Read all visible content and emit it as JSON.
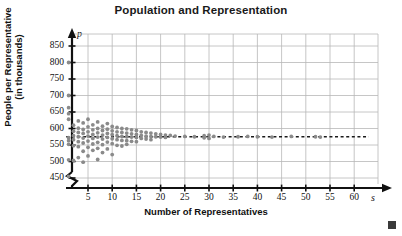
{
  "chart_data": {
    "type": "scatter",
    "title": "Population and Representation",
    "xlabel": "Number of Representatives",
    "ylabel_line1": "People per Representative",
    "ylabel_line2": "(in thousands)",
    "x_variable": "s",
    "y_variable": "p",
    "xlim": [
      0,
      63
    ],
    "ylim": [
      440,
      870
    ],
    "xticks": [
      5,
      10,
      15,
      20,
      25,
      30,
      35,
      40,
      45,
      50,
      55,
      60
    ],
    "yticks": [
      450,
      500,
      550,
      600,
      650,
      700,
      750,
      800,
      850
    ],
    "grid": true,
    "y_axis_break": true,
    "legend": "none",
    "marker_color": "#8a8a8a",
    "grid_color": "#b8b8b8",
    "axis_color": "#111111",
    "trend_line": {
      "type": "horizontal-dashed",
      "value": 575,
      "x_start": 0.5,
      "x_end": 63,
      "color": "#1a1a1a",
      "style": "dashed"
    },
    "points": [
      [
        1,
        800
      ],
      [
        1,
        700
      ],
      [
        1,
        663
      ],
      [
        1,
        645
      ],
      [
        1,
        628
      ],
      [
        1,
        572
      ],
      [
        1,
        563
      ],
      [
        1,
        552
      ],
      [
        1,
        505
      ],
      [
        1,
        455
      ],
      [
        2,
        610
      ],
      [
        2,
        592
      ],
      [
        2,
        578
      ],
      [
        2,
        566
      ],
      [
        2,
        548
      ],
      [
        2,
        503
      ],
      [
        3,
        623
      ],
      [
        3,
        601
      ],
      [
        3,
        588
      ],
      [
        3,
        575
      ],
      [
        3,
        560
      ],
      [
        3,
        545
      ],
      [
        3,
        512
      ],
      [
        4,
        617
      ],
      [
        4,
        597
      ],
      [
        4,
        585
      ],
      [
        4,
        571
      ],
      [
        4,
        556
      ],
      [
        4,
        531
      ],
      [
        4,
        498
      ],
      [
        5,
        628
      ],
      [
        5,
        605
      ],
      [
        5,
        590
      ],
      [
        5,
        577
      ],
      [
        5,
        562
      ],
      [
        5,
        543
      ],
      [
        5,
        517
      ],
      [
        6,
        611
      ],
      [
        6,
        596
      ],
      [
        6,
        582
      ],
      [
        6,
        570
      ],
      [
        6,
        553
      ],
      [
        6,
        534
      ],
      [
        7,
        620
      ],
      [
        7,
        600
      ],
      [
        7,
        587
      ],
      [
        7,
        574
      ],
      [
        7,
        558
      ],
      [
        7,
        540
      ],
      [
        7,
        506
      ],
      [
        8,
        607
      ],
      [
        8,
        594
      ],
      [
        8,
        580
      ],
      [
        8,
        568
      ],
      [
        8,
        551
      ],
      [
        8,
        527
      ],
      [
        9,
        615
      ],
      [
        9,
        598
      ],
      [
        9,
        585
      ],
      [
        9,
        573
      ],
      [
        9,
        559
      ],
      [
        9,
        538
      ],
      [
        10,
        606
      ],
      [
        10,
        593
      ],
      [
        10,
        581
      ],
      [
        10,
        569
      ],
      [
        10,
        554
      ],
      [
        10,
        521
      ],
      [
        11,
        603
      ],
      [
        11,
        590
      ],
      [
        11,
        578
      ],
      [
        11,
        566
      ],
      [
        11,
        549
      ],
      [
        12,
        600
      ],
      [
        12,
        588
      ],
      [
        12,
        576
      ],
      [
        12,
        564
      ],
      [
        12,
        547
      ],
      [
        13,
        599
      ],
      [
        13,
        586
      ],
      [
        13,
        575
      ],
      [
        13,
        563
      ],
      [
        13,
        552
      ],
      [
        14,
        596
      ],
      [
        14,
        584
      ],
      [
        14,
        574
      ],
      [
        14,
        561
      ],
      [
        15,
        594
      ],
      [
        15,
        582
      ],
      [
        15,
        573
      ],
      [
        15,
        560
      ],
      [
        16,
        590
      ],
      [
        16,
        579
      ],
      [
        16,
        570
      ],
      [
        17,
        588
      ],
      [
        17,
        577
      ],
      [
        17,
        568
      ],
      [
        18,
        586
      ],
      [
        18,
        576
      ],
      [
        18,
        566
      ],
      [
        19,
        584
      ],
      [
        19,
        575
      ],
      [
        20,
        582
      ],
      [
        20,
        574
      ],
      [
        21,
        580
      ],
      [
        21,
        573
      ],
      [
        22,
        579
      ],
      [
        23,
        577
      ],
      [
        25,
        576
      ],
      [
        27,
        575
      ],
      [
        29,
        578
      ],
      [
        29,
        572
      ],
      [
        30,
        580
      ],
      [
        30,
        570
      ],
      [
        31,
        576
      ],
      [
        33,
        574
      ],
      [
        36,
        575
      ],
      [
        38,
        576
      ],
      [
        40,
        575
      ],
      [
        43,
        574
      ],
      [
        47,
        576
      ],
      [
        52,
        575
      ],
      [
        53,
        574
      ]
    ]
  }
}
